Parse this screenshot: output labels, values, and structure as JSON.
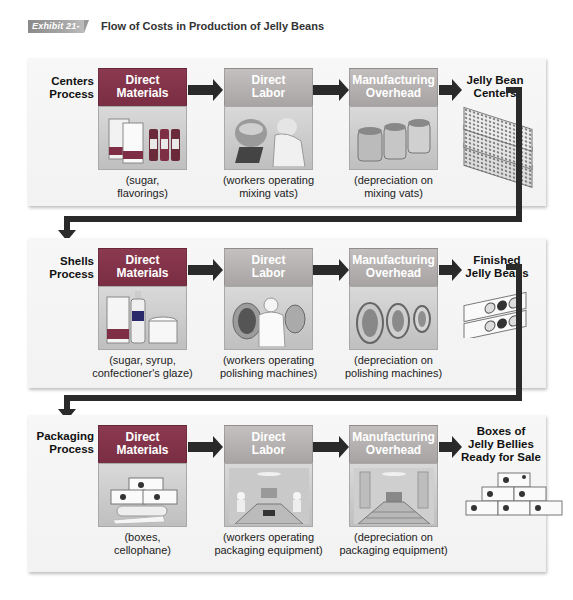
{
  "header": {
    "exhibit_tag": "Exhibit 21-2",
    "title": "Flow of Costs in Production of Jelly Beans"
  },
  "colors": {
    "direct_materials": "#7e2f45",
    "direct_labor": "#b5b1b0",
    "manufacturing_overhead": "#b3afae",
    "arrow": "#2a2a2a",
    "panel_bg": "#f4f4f4"
  },
  "processes": [
    {
      "label_line1": "Centers",
      "label_line2": "Process",
      "direct_materials": {
        "title_line1": "Direct",
        "title_line2": "Materials",
        "caption_line1": "(sugar,",
        "caption_line2": "flavorings)",
        "image": "sugar-bags-and-flavoring-bottles"
      },
      "direct_labor": {
        "title_line1": "Direct",
        "title_line2": "Labor",
        "caption_line1": "(workers operating",
        "caption_line2": "mixing vats)",
        "image": "worker-at-mixing-vats"
      },
      "manufacturing_overhead": {
        "title_line1": "Manufacturing",
        "title_line2": "Overhead",
        "caption_line1": "(depreciation on",
        "caption_line2": "mixing vats)",
        "image": "mixing-vats"
      },
      "output": {
        "line1": "Jelly Bean",
        "line2": "Centers",
        "line3": "",
        "image": "stacked-trays-of-centers"
      }
    },
    {
      "label_line1": "Shells",
      "label_line2": "Process",
      "direct_materials": {
        "title_line1": "Direct",
        "title_line2": "Materials",
        "caption_line1": "(sugar, syrup,",
        "caption_line2": "confectioner's glaze)",
        "image": "sugar-syrup-and-glaze"
      },
      "direct_labor": {
        "title_line1": "Direct",
        "title_line2": "Labor",
        "caption_line1": "(workers operating",
        "caption_line2": "polishing machines)",
        "image": "worker-at-polishing-machines"
      },
      "manufacturing_overhead": {
        "title_line1": "Manufacturing",
        "title_line2": "Overhead",
        "caption_line1": "(depreciation on",
        "caption_line2": "polishing machines)",
        "image": "polishing-drums"
      },
      "output": {
        "line1": "Finished",
        "line2": "Jelly Beans",
        "line3": "",
        "image": "jelly-bean-boxes"
      }
    },
    {
      "label_line1": "Packaging",
      "label_line2": "Process",
      "direct_materials": {
        "title_line1": "Direct",
        "title_line2": "Materials",
        "caption_line1": "(boxes,",
        "caption_line2": "cellophane)",
        "image": "boxes-and-cellophane-roll"
      },
      "direct_labor": {
        "title_line1": "Direct",
        "title_line2": "Labor",
        "caption_line1": "(workers operating",
        "caption_line2": "packaging equipment)",
        "image": "workers-at-packaging-line"
      },
      "manufacturing_overhead": {
        "title_line1": "Manufacturing",
        "title_line2": "Overhead",
        "caption_line1": "(depreciation on",
        "caption_line2": "packaging equipment)",
        "image": "packaging-conveyor"
      },
      "output": {
        "line1": "Boxes of",
        "line2": "Jelly Bellies",
        "line3": "Ready for Sale",
        "image": "pyramid-of-boxes"
      }
    }
  ]
}
